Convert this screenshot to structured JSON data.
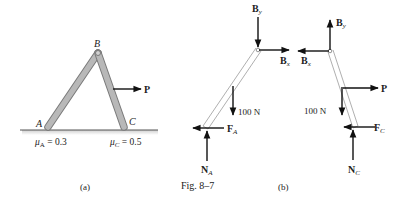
{
  "figure": {
    "caption": "Fig. 8–7",
    "panel_a_label": "(a)",
    "panel_b_label": "(b)"
  },
  "panel_a": {
    "points": {
      "A": "A",
      "B": "B",
      "C": "C"
    },
    "force_P": "P",
    "mu_A": {
      "symbol": "μ",
      "sub": "A",
      "value": " = 0.3"
    },
    "mu_C": {
      "symbol": "μ",
      "sub": "C",
      "value": " = 0.5"
    }
  },
  "panel_b_left": {
    "By": {
      "main": "B",
      "sub": "y"
    },
    "Bx": {
      "main": "B",
      "sub": "x"
    },
    "weight": "100 N",
    "FA": {
      "main": "F",
      "sub": "A"
    },
    "NA": {
      "main": "N",
      "sub": "A"
    }
  },
  "panel_b_right": {
    "By": {
      "main": "B",
      "sub": "y"
    },
    "Bx": {
      "main": "B",
      "sub": "x"
    },
    "P": "P",
    "weight": "100 N",
    "FC": {
      "main": "F",
      "sub": "C"
    },
    "NC": {
      "main": "N",
      "sub": "C"
    }
  },
  "colors": {
    "member_fill": "#b8b8b8",
    "member_edge": "#7a7a7a",
    "fbd_member_edge": "#9a9a9a",
    "arrow": "#111111",
    "ground": "#555555"
  }
}
